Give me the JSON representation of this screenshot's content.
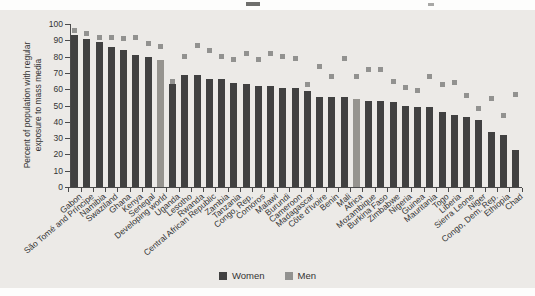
{
  "figure": {
    "panel_bg": "#eceae7",
    "axis_color": "#4a4a4a",
    "text_color": "#333333"
  },
  "chart_data": {
    "type": "bar",
    "subtype": "bars-with-square-markers",
    "title": "",
    "ylabel": "Percent of population with regular exposure to mass media",
    "ylabel_lines": [
      "Percent of population with regular",
      "exposure to mass media"
    ],
    "xlabel": "",
    "ylim": [
      0,
      100
    ],
    "yticks": [
      100,
      90,
      80,
      70,
      60,
      50,
      40,
      30,
      20,
      10,
      0
    ],
    "grid": false,
    "legend_position": "bottom-center",
    "marker_shape": "square",
    "women_color": "#414141",
    "men_color": "#929290",
    "aggregate_bar_color": "#96948f",
    "aggregate_categories": [
      "Developing world",
      "Africa"
    ],
    "categories": [
      "Gabon",
      "São Tomé and Príncipe",
      "Namibia",
      "Swaziland",
      "Ghana",
      "Kenya",
      "Senegal",
      "Developing world",
      "Uganda",
      "Lesotho",
      "Rwanda",
      "Central African Republic",
      "Zambia",
      "Tanzania",
      "Congo, Rep.",
      "Comoros",
      "Malawi",
      "Burundi",
      "Cameroon",
      "Madagascar",
      "Côte d'Ivoire",
      "Benin",
      "Mali",
      "Africa",
      "Mozambique",
      "Burkina Faso",
      "Zimbabwe",
      "Nigeria",
      "Guinea",
      "Mauritania",
      "Togo",
      "Liberia",
      "Sierra Leone",
      "Niger",
      "Congo, Dem. Rep.",
      "Ethiopia",
      "Chad"
    ],
    "series": [
      {
        "name": "Women",
        "render": "bar",
        "values": [
          93,
          91,
          89,
          86,
          84,
          81,
          80,
          78,
          63,
          69,
          69,
          66,
          66,
          64,
          63,
          62,
          62,
          61,
          61,
          59,
          55,
          55,
          55,
          54,
          53,
          53,
          52,
          50,
          49,
          49,
          46,
          44,
          43,
          41,
          34,
          32,
          23
        ]
      },
      {
        "name": "Men",
        "render": "square-marker",
        "values": [
          96,
          94,
          92,
          92,
          91,
          92,
          88,
          86,
          65,
          80,
          87,
          84,
          80,
          78,
          82,
          78,
          82,
          80,
          79,
          63,
          74,
          68,
          79,
          68,
          72,
          72,
          65,
          61,
          59,
          68,
          63,
          64,
          56,
          48,
          54,
          44,
          57
        ]
      }
    ],
    "legend": [
      {
        "label": "Women",
        "color": "#414141"
      },
      {
        "label": "Men",
        "color": "#929290"
      }
    ]
  }
}
